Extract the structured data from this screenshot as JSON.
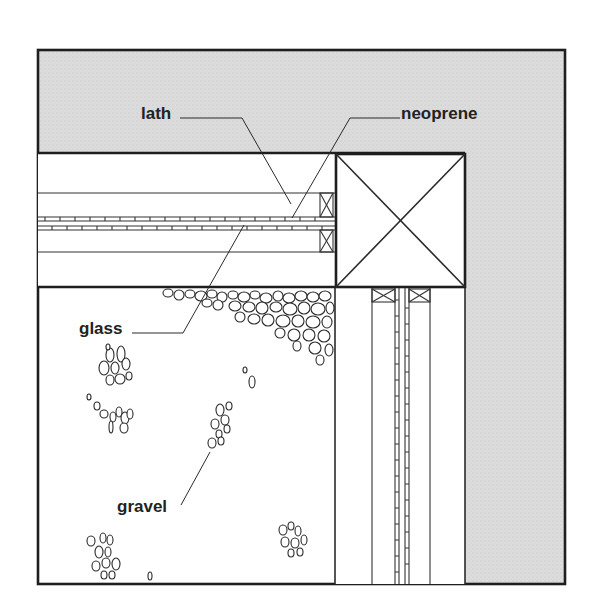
{
  "diagram": {
    "type": "architectural-section-plan",
    "colors": {
      "background": "#ffffff",
      "soil_fill": "#d9d9d9",
      "line": "#1e1e1e",
      "label": "#222222"
    },
    "labels": {
      "lath": "lath",
      "neoprene": "neoprene",
      "glass": "glass",
      "gravel": "gravel"
    },
    "components": [
      {
        "id": "outer-frame",
        "kind": "rectangle"
      },
      {
        "id": "soil-top",
        "kind": "shaded-band"
      },
      {
        "id": "soil-right",
        "kind": "shaded-band"
      },
      {
        "id": "corner-post",
        "kind": "square-with-cross"
      },
      {
        "id": "horizontal-wall",
        "kind": "layered-wall",
        "layers": [
          "lath",
          "glass",
          "neoprene",
          "glass",
          "lath"
        ]
      },
      {
        "id": "vertical-wall",
        "kind": "layered-wall",
        "layers": [
          "lath",
          "glass",
          "neoprene",
          "glass",
          "lath"
        ]
      },
      {
        "id": "gravel-bed",
        "kind": "pebble-clusters"
      }
    ]
  }
}
